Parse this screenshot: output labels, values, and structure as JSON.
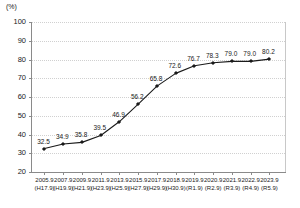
{
  "chart_data": {
    "type": "line",
    "title": "",
    "subtitle": "",
    "xlabel": "",
    "ylabel": "(%)",
    "ylim": [
      20,
      100
    ],
    "yticks": [
      20,
      30,
      40,
      50,
      60,
      70,
      80,
      90,
      100
    ],
    "grid": true,
    "legend": "none",
    "categories": [
      "2005.9",
      "2007.9",
      "2009.9",
      "2011.9",
      "2013.9",
      "2015.9",
      "2017.9",
      "2018.9",
      "2019.9",
      "2020.9",
      "2021.9",
      "2022.9",
      "2023.9"
    ],
    "categories_sub": [
      "(H17.9)",
      "(H19.9)",
      "(H21.9)",
      "(H23.9)",
      "(H25.9)",
      "(H27.9)",
      "(H29.9)",
      "(H30.9)",
      "(R1.9)",
      "(R2.9)",
      "(R3.9)",
      "(R4.9)",
      "(R5.9)"
    ],
    "values": [
      32.5,
      34.9,
      35.8,
      39.5,
      46.9,
      56.2,
      65.8,
      72.6,
      76.7,
      78.3,
      79.0,
      79.0,
      80.2
    ],
    "point_labels": [
      "32.5",
      "34.9",
      "35.8",
      "39.5",
      "46.9",
      "56.2",
      "65.8",
      "72.6",
      "76.7",
      "78.3",
      "79.0",
      "79.0",
      "80.2"
    ],
    "series": [
      {
        "name": "",
        "values": [
          32.5,
          34.9,
          35.8,
          39.5,
          46.9,
          56.2,
          65.8,
          72.6,
          76.7,
          78.3,
          79.0,
          79.0,
          80.2
        ]
      }
    ],
    "colors": {
      "line": "#1a1a1a",
      "marker": "#1a1a1a",
      "grid": "#d0d0d0",
      "axis": "#8a8a8a",
      "text": "#1a1a1a",
      "background": "#ffffff"
    }
  }
}
